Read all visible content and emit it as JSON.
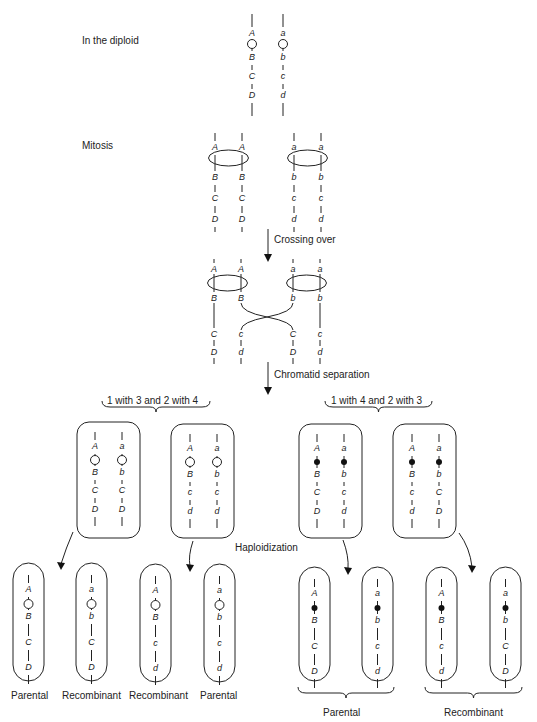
{
  "stages": {
    "diploid": "In the diploid",
    "mitosis": "Mitosis",
    "crossing_over": "Crossing over",
    "chromatid_separation": "Chromatid separation",
    "haploidization": "Haploidization"
  },
  "diploid": {
    "chromosomes": [
      {
        "genes": [
          "A",
          "B",
          "C",
          "D"
        ],
        "centromere": "open"
      },
      {
        "genes": [
          "a",
          "b",
          "c",
          "d"
        ],
        "centromere": "open"
      }
    ]
  },
  "mitosis": {
    "chromatids": [
      {
        "genes": [
          "A",
          "B",
          "C",
          "D"
        ]
      },
      {
        "genes": [
          "A",
          "B",
          "C",
          "D"
        ]
      },
      {
        "genes": [
          "a",
          "b",
          "c",
          "d"
        ]
      },
      {
        "genes": [
          "a",
          "b",
          "c",
          "d"
        ]
      }
    ]
  },
  "crossing_over": {
    "chromatids": [
      {
        "genes": [
          "A",
          "B",
          "C",
          "D"
        ]
      },
      {
        "genes": [
          "A",
          "B",
          "c",
          "d"
        ]
      },
      {
        "genes": [
          "a",
          "b",
          "C",
          "D"
        ]
      },
      {
        "genes": [
          "a",
          "b",
          "c",
          "d"
        ]
      }
    ]
  },
  "segregation": {
    "left": {
      "label": "1 with 3 and 2 with 4",
      "centromere": "open",
      "cells": [
        {
          "chromosomes": [
            [
              "A",
              "B",
              "C",
              "D"
            ],
            [
              "a",
              "b",
              "C",
              "D"
            ]
          ]
        },
        {
          "chromosomes": [
            [
              "A",
              "B",
              "c",
              "d"
            ],
            [
              "a",
              "b",
              "c",
              "d"
            ]
          ]
        }
      ]
    },
    "right": {
      "label": "1 with 4 and 2 with 3",
      "centromere": "filled",
      "cells": [
        {
          "chromosomes": [
            [
              "A",
              "B",
              "C",
              "D"
            ],
            [
              "a",
              "b",
              "c",
              "d"
            ]
          ]
        },
        {
          "chromosomes": [
            [
              "A",
              "B",
              "c",
              "d"
            ],
            [
              "a",
              "b",
              "C",
              "D"
            ]
          ]
        }
      ]
    }
  },
  "haploids": {
    "left": [
      {
        "genes": [
          "A",
          "B",
          "C",
          "D"
        ],
        "label": "Parental"
      },
      {
        "genes": [
          "a",
          "b",
          "C",
          "D"
        ],
        "label": "Recombinant"
      },
      {
        "genes": [
          "A",
          "B",
          "c",
          "d"
        ],
        "label": "Recombinant"
      },
      {
        "genes": [
          "a",
          "b",
          "c",
          "d"
        ],
        "label": "Parental"
      }
    ],
    "right": [
      {
        "genes": [
          "A",
          "B",
          "C",
          "D"
        ]
      },
      {
        "genes": [
          "a",
          "b",
          "c",
          "d"
        ]
      },
      {
        "genes": [
          "A",
          "B",
          "c",
          "d"
        ]
      },
      {
        "genes": [
          "a",
          "b",
          "C",
          "D"
        ]
      }
    ],
    "right_group_labels": [
      "Parental",
      "Recombinant"
    ]
  }
}
